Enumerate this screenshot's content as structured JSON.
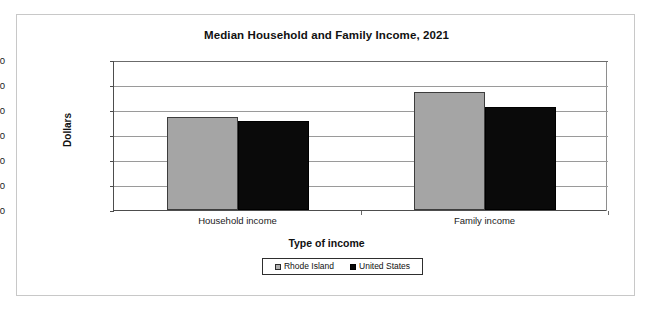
{
  "chart_data": {
    "type": "bar",
    "title": "Median Household and Family Income, 2021",
    "xlabel": "Type of income",
    "ylabel": "Dollars",
    "categories": [
      "Household income",
      "Family income"
    ],
    "series": [
      {
        "name": "Rhode Island",
        "color": "#a5a5a5",
        "values": [
          74500,
          94400
        ]
      },
      {
        "name": "United States",
        "color": "#0a0a0a",
        "values": [
          71500,
          82600
        ]
      }
    ],
    "ylim": [
      0,
      120000
    ],
    "ytick_values": [
      120000,
      100000,
      80000,
      60000,
      40000,
      20000,
      0
    ],
    "ytick_labels": [
      "120,000",
      "100,000",
      "80,000",
      "60,000",
      "40,000",
      "20,000",
      "0"
    ],
    "grid": true,
    "legend_position": "bottom-center"
  },
  "legend": {
    "entries": [
      {
        "label": "Rhode Island",
        "marker": "gray-square-marker"
      },
      {
        "label": "United States",
        "marker": "black-square-marker"
      }
    ]
  }
}
